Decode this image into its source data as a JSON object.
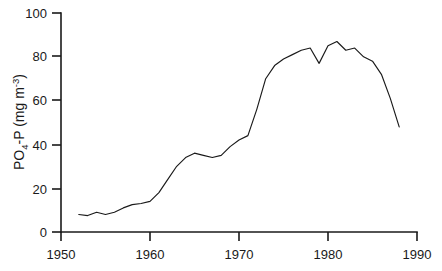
{
  "chart_data": {
    "type": "line",
    "title": "",
    "subtitle": "",
    "xlabel": "",
    "ylabel": "PO4-P  (mg m-3)",
    "ylabel_parts": {
      "prefix": "PO",
      "sub": "4",
      "mid": "-P  (mg m",
      "sup": "-3",
      "suffix": ")"
    },
    "xlim": [
      1950,
      1990
    ],
    "ylim": [
      0,
      100
    ],
    "xticks": [
      1950,
      1960,
      1970,
      1980,
      1990
    ],
    "xtick_labels": [
      "1950",
      "1960",
      "1970",
      "1980",
      "1990"
    ],
    "yticks": [
      0,
      20,
      40,
      60,
      80,
      100
    ],
    "ytick_labels": [
      "0",
      "20",
      "40",
      "60",
      "80",
      "100"
    ],
    "grid": false,
    "legend": null,
    "legend_position": "none",
    "line_color": "#1a1a1a",
    "axis_color": "#1a1a1a",
    "background_color": "#ffffff",
    "series": [
      {
        "name": "PO4-P concentration",
        "x": [
          1952,
          1953,
          1954,
          1955,
          1956,
          1957,
          1958,
          1959,
          1960,
          1961,
          1962,
          1963,
          1964,
          1965,
          1966,
          1967,
          1968,
          1969,
          1970,
          1971,
          1972,
          1973,
          1974,
          1975,
          1976,
          1977,
          1978,
          1979,
          1980,
          1981,
          1982,
          1983,
          1984,
          1985,
          1986,
          1987,
          1988
        ],
        "values": [
          8,
          7.5,
          9,
          8,
          9,
          11,
          12.5,
          13,
          14,
          18,
          24,
          30,
          34,
          36,
          35,
          34,
          35,
          39,
          42,
          44,
          56,
          70,
          76,
          79,
          81,
          83,
          84,
          77,
          85,
          87,
          83,
          84,
          80,
          78,
          72,
          61,
          48
        ]
      }
    ]
  }
}
